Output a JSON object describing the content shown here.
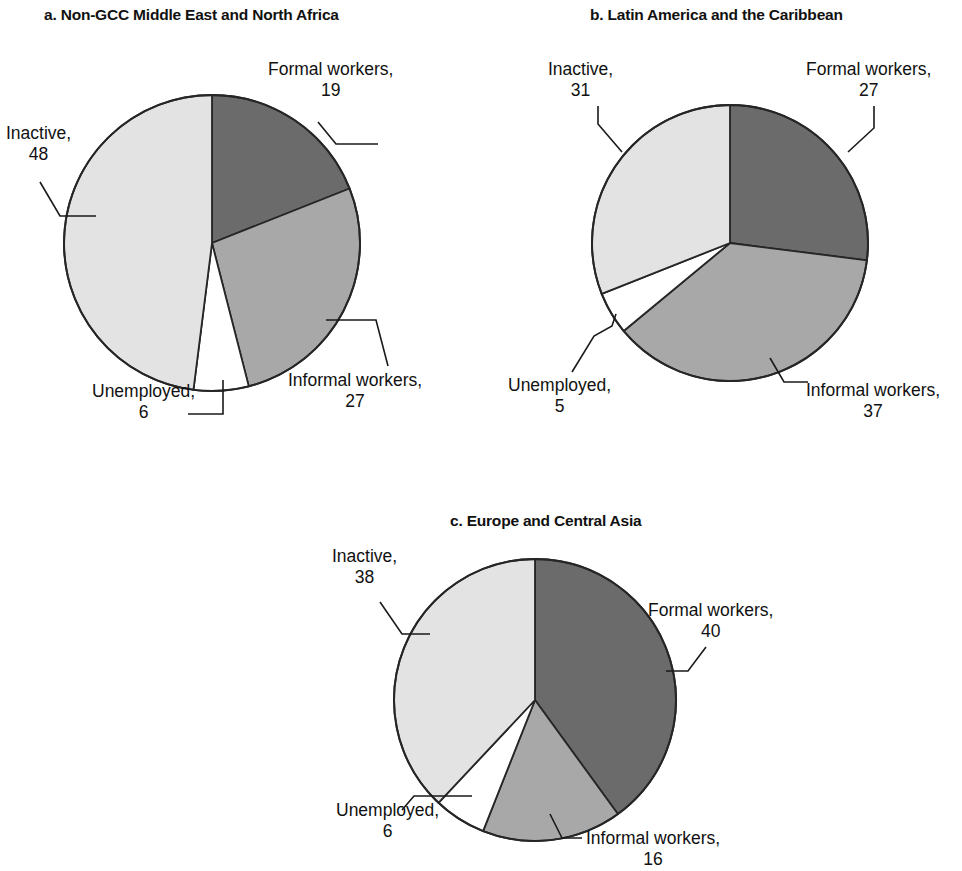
{
  "figure": {
    "background": "#ffffff",
    "outline_color": "#262626"
  },
  "palette": {
    "formal": "#6b6b6b",
    "informal": "#a8a8a8",
    "unemployed": "#ffffff",
    "inactive": "#e3e3e3"
  },
  "panels": [
    {
      "key": "a",
      "title": "a. Non-GCC Middle East and North Africa",
      "labels": {
        "formal": {
          "name": "Formal workers,",
          "value": "19"
        },
        "informal": {
          "name": "Informal workers,",
          "value": "27"
        },
        "unemployed": {
          "name": "Unemployed,",
          "value": "6"
        },
        "inactive": {
          "name": "Inactive,",
          "value": "48"
        }
      }
    },
    {
      "key": "b",
      "title": "b. Latin America and the Caribbean",
      "labels": {
        "formal": {
          "name": "Formal workers,",
          "value": "27"
        },
        "informal": {
          "name": "Informal workers,",
          "value": "37"
        },
        "unemployed": {
          "name": "Unemployed,",
          "value": "5"
        },
        "inactive": {
          "name": "Inactive,",
          "value": "31"
        }
      }
    },
    {
      "key": "c",
      "title": "c. Europe and Central Asia",
      "labels": {
        "formal": {
          "name": "Formal workers,",
          "value": "40"
        },
        "informal": {
          "name": "Informal workers,",
          "value": "16"
        },
        "unemployed": {
          "name": "Unemployed,",
          "value": "6"
        },
        "inactive": {
          "name": "Inactive,",
          "value": "38"
        }
      }
    }
  ],
  "chart_data": [
    {
      "type": "pie",
      "title": "a. Non-GCC Middle East and North Africa",
      "categories": [
        "Formal workers",
        "Informal workers",
        "Unemployed",
        "Inactive"
      ],
      "values": [
        19,
        27,
        6,
        48
      ],
      "colors": [
        "#6b6b6b",
        "#a8a8a8",
        "#ffffff",
        "#e3e3e3"
      ],
      "units": "percent",
      "start_angle_deg": 0,
      "direction": "clockwise",
      "legend": "none (direct labels with leader lines)"
    },
    {
      "type": "pie",
      "title": "b. Latin America and the Caribbean",
      "categories": [
        "Formal workers",
        "Informal workers",
        "Unemployed",
        "Inactive"
      ],
      "values": [
        27,
        37,
        5,
        31
      ],
      "colors": [
        "#6b6b6b",
        "#a8a8a8",
        "#ffffff",
        "#e3e3e3"
      ],
      "units": "percent",
      "start_angle_deg": 0,
      "direction": "clockwise",
      "legend": "none (direct labels with leader lines)"
    },
    {
      "type": "pie",
      "title": "c. Europe and Central Asia",
      "categories": [
        "Formal workers",
        "Informal workers",
        "Unemployed",
        "Inactive"
      ],
      "values": [
        40,
        16,
        6,
        38
      ],
      "colors": [
        "#6b6b6b",
        "#a8a8a8",
        "#ffffff",
        "#e3e3e3"
      ],
      "units": "percent",
      "start_angle_deg": 0,
      "direction": "clockwise",
      "legend": "none (direct labels with leader lines)"
    }
  ]
}
